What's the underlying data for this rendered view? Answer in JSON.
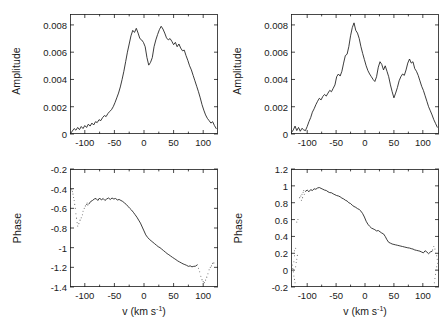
{
  "figure": {
    "background": "#ffffff",
    "line_color": "#1a1a1a",
    "noise_color": "#6e6e6e",
    "layout": "2x2 grid: amplitude spectra on top row, phase spectra on bottom row"
  },
  "axis_labels": {
    "amplitude": "Amplitude",
    "phase": "Phase",
    "velocity_prefix": "v (km s",
    "velocity_exponent": "-1",
    "velocity_suffix": ")"
  },
  "chart_data": [
    {
      "id": "top-left-amplitude",
      "type": "line",
      "title": "",
      "xlabel": "v (km s-1)",
      "ylabel": "Amplitude",
      "xlim": [
        -125,
        125
      ],
      "ylim": [
        0,
        0.0088
      ],
      "xticks": [
        -100,
        -50,
        0,
        50,
        100
      ],
      "xtick_labels": [
        "-100",
        "-50",
        "0",
        "50",
        "100"
      ],
      "yticks": [
        0,
        0.002,
        0.004,
        0.006,
        0.008
      ],
      "ytick_labels": [
        "0",
        "0.002",
        "0.004",
        "0.006",
        "0.008"
      ],
      "grid": false,
      "legend": "none",
      "x": [
        -124,
        -121,
        -118,
        -115,
        -112,
        -109,
        -106,
        -103,
        -100,
        -97,
        -94,
        -91,
        -88,
        -85,
        -82,
        -79,
        -76,
        -73,
        -70,
        -67,
        -64,
        -61,
        -58,
        -55,
        -52,
        -49,
        -46,
        -43,
        -40,
        -37,
        -34,
        -31,
        -28,
        -25,
        -22,
        -19,
        -16,
        -13,
        -10,
        -7,
        -4,
        -1,
        2,
        5,
        8,
        11,
        14,
        17,
        20,
        23,
        26,
        29,
        32,
        35,
        38,
        41,
        44,
        47,
        50,
        53,
        56,
        59,
        62,
        65,
        68,
        71,
        74,
        77,
        80,
        83,
        86,
        89,
        92,
        95,
        98,
        101,
        104,
        107,
        110,
        113,
        116,
        119,
        122
      ],
      "y": [
        5e-05,
        0.00022,
        0.0004,
        0.00028,
        0.00048,
        0.00032,
        0.00055,
        0.0004,
        0.00062,
        0.00048,
        0.00072,
        0.00058,
        0.0008,
        0.00066,
        0.0009,
        0.00084,
        0.00105,
        0.00098,
        0.0012,
        0.00135,
        0.00128,
        0.0015,
        0.00165,
        0.00178,
        0.002,
        0.0023,
        0.00265,
        0.003,
        0.00345,
        0.004,
        0.0046,
        0.0053,
        0.006,
        0.0066,
        0.0072,
        0.0076,
        0.00745,
        0.00775,
        0.0074,
        0.007,
        0.0069,
        0.00672,
        0.0064,
        0.0056,
        0.00505,
        0.00525,
        0.0056,
        0.0064,
        0.0069,
        0.0073,
        0.00765,
        0.0079,
        0.0077,
        0.0074,
        0.00705,
        0.0069,
        0.007,
        0.0068,
        0.00655,
        0.00672,
        0.0064,
        0.0066,
        0.0063,
        0.0061,
        0.00615,
        0.00575,
        0.0054,
        0.005,
        0.0047,
        0.0043,
        0.0039,
        0.0035,
        0.0031,
        0.00265,
        0.00215,
        0.00175,
        0.0014,
        0.00115,
        0.00098,
        0.0008,
        0.0009,
        0.00062,
        0.0004,
        0.0001
      ]
    },
    {
      "id": "top-right-amplitude",
      "type": "line",
      "title": "",
      "xlabel": "v (km s-1)",
      "ylabel": "Amplitude",
      "xlim": [
        -128,
        128
      ],
      "ylim": [
        0,
        0.0088
      ],
      "xticks": [
        -100,
        -50,
        0,
        50,
        100
      ],
      "xtick_labels": [
        "-100",
        "-50",
        "0",
        "50",
        "100"
      ],
      "yticks": [
        0,
        0.002,
        0.004,
        0.006,
        0.008
      ],
      "ytick_labels": [
        "0",
        "0.002",
        "0.004",
        "0.006",
        "0.008"
      ],
      "grid": false,
      "legend": "none",
      "x": [
        -127,
        -124,
        -121,
        -118,
        -115,
        -112,
        -109,
        -106,
        -103,
        -100,
        -97,
        -94,
        -91,
        -88,
        -85,
        -82,
        -79,
        -76,
        -73,
        -70,
        -67,
        -64,
        -61,
        -58,
        -55,
        -52,
        -49,
        -46,
        -43,
        -40,
        -37,
        -34,
        -31,
        -28,
        -25,
        -22,
        -19,
        -16,
        -13,
        -10,
        -7,
        -4,
        -1,
        2,
        5,
        8,
        11,
        14,
        17,
        20,
        23,
        26,
        29,
        32,
        35,
        38,
        41,
        44,
        47,
        50,
        53,
        56,
        59,
        62,
        65,
        68,
        71,
        74,
        77,
        80,
        83,
        86,
        89,
        92,
        95,
        98,
        101,
        104,
        107,
        110,
        113,
        116,
        119,
        122,
        125
      ],
      "y": [
        0.00012,
        0.0003,
        0.00058,
        0.00025,
        0.00048,
        0.0002,
        0.00042,
        0.0003,
        0.00025,
        0.00055,
        0.0009,
        0.0012,
        0.0016,
        0.00185,
        0.00215,
        0.0024,
        0.00262,
        0.0025,
        0.00275,
        0.0029,
        0.00278,
        0.003,
        0.0032,
        0.0031,
        0.00335,
        0.0036,
        0.0042,
        0.0044,
        0.00425,
        0.0046,
        0.0052,
        0.00575,
        0.00585,
        0.0064,
        0.0072,
        0.0078,
        0.00815,
        0.0076,
        0.0074,
        0.007,
        0.0064,
        0.0059,
        0.00545,
        0.005,
        0.00465,
        0.0044,
        0.0042,
        0.004,
        0.00385,
        0.0042,
        0.0049,
        0.0053,
        0.0051,
        0.0047,
        0.005,
        0.0046,
        0.0042,
        0.0036,
        0.0031,
        0.00265,
        0.003,
        0.0034,
        0.0039,
        0.0042,
        0.0044,
        0.0043,
        0.0047,
        0.0052,
        0.0055,
        0.0052,
        0.0053,
        0.0048,
        0.0046,
        0.0043,
        0.0039,
        0.0035,
        0.0032,
        0.0028,
        0.0024,
        0.002,
        0.0017,
        0.0014,
        0.00105,
        0.00078,
        0.0005
      ]
    },
    {
      "id": "bottom-left-phase",
      "type": "line",
      "title": "",
      "xlabel": "v (km s-1)",
      "ylabel": "Phase",
      "xlim": [
        -125,
        125
      ],
      "ylim": [
        -1.4,
        -0.2
      ],
      "xticks": [
        -100,
        -50,
        0,
        50,
        100
      ],
      "xtick_labels": [
        "-100",
        "-50",
        "0",
        "50",
        "100"
      ],
      "yticks": [
        -1.4,
        -1.2,
        -1.0,
        -0.8,
        -0.6,
        -0.4,
        -0.2
      ],
      "ytick_labels": [
        "-1.4",
        "-1.2",
        "-1",
        "-0.8",
        "-0.6",
        "-0.4",
        "-0.2"
      ],
      "grid": false,
      "legend": "none",
      "x": [
        -93,
        -90,
        -87,
        -84,
        -81,
        -78,
        -75,
        -72,
        -69,
        -66,
        -63,
        -60,
        -57,
        -54,
        -51,
        -48,
        -45,
        -42,
        -39,
        -36,
        -33,
        -30,
        -27,
        -24,
        -21,
        -18,
        -15,
        -12,
        -9,
        -6,
        -3,
        0,
        3,
        6,
        9,
        12,
        15,
        18,
        21,
        24,
        27,
        30,
        33,
        36,
        39,
        42,
        45,
        48,
        51,
        54,
        57,
        60,
        63,
        66,
        69,
        72,
        75,
        78,
        81,
        84,
        87,
        90
      ],
      "y": [
        -0.555,
        -0.53,
        -0.52,
        -0.505,
        -0.5,
        -0.52,
        -0.495,
        -0.515,
        -0.5,
        -0.52,
        -0.505,
        -0.495,
        -0.51,
        -0.495,
        -0.505,
        -0.5,
        -0.515,
        -0.51,
        -0.52,
        -0.53,
        -0.545,
        -0.56,
        -0.58,
        -0.6,
        -0.618,
        -0.64,
        -0.665,
        -0.69,
        -0.72,
        -0.75,
        -0.79,
        -0.83,
        -0.87,
        -0.895,
        -0.915,
        -0.93,
        -0.945,
        -0.96,
        -0.975,
        -0.99,
        -1.0,
        -1.015,
        -1.03,
        -1.045,
        -1.06,
        -1.072,
        -1.085,
        -1.098,
        -1.11,
        -1.122,
        -1.135,
        -1.145,
        -1.155,
        -1.165,
        -1.172,
        -1.18,
        -1.19,
        -1.185,
        -1.195,
        -1.19,
        -1.188,
        -1.175
      ],
      "noise_points": [
        {
          "x": -122,
          "y": -0.41
        },
        {
          "x": -121,
          "y": -0.43
        },
        {
          "x": -120,
          "y": -0.455
        },
        {
          "x": -119,
          "y": -0.49
        },
        {
          "x": -118,
          "y": -0.52
        },
        {
          "x": -117,
          "y": -0.56
        },
        {
          "x": -116,
          "y": -0.6
        },
        {
          "x": -115,
          "y": -0.655
        },
        {
          "x": -114,
          "y": -0.7
        },
        {
          "x": -113,
          "y": -0.745
        },
        {
          "x": -112,
          "y": -0.78
        },
        {
          "x": -110,
          "y": -0.755
        },
        {
          "x": -108,
          "y": -0.72
        },
        {
          "x": -106,
          "y": -0.695
        },
        {
          "x": -104,
          "y": -0.665
        },
        {
          "x": -103,
          "y": -0.63
        },
        {
          "x": -101,
          "y": -0.6
        },
        {
          "x": -99,
          "y": -0.575
        },
        {
          "x": -97,
          "y": -0.56
        },
        {
          "x": -96,
          "y": -0.545
        },
        {
          "x": -95,
          "y": -0.565
        },
        {
          "x": 92,
          "y": -1.21
        },
        {
          "x": 94,
          "y": -1.245
        },
        {
          "x": 96,
          "y": -1.29
        },
        {
          "x": 98,
          "y": -1.325
        },
        {
          "x": 100,
          "y": -1.345
        },
        {
          "x": 102,
          "y": -1.355
        },
        {
          "x": 104,
          "y": -1.33
        },
        {
          "x": 106,
          "y": -1.3
        },
        {
          "x": 108,
          "y": -1.265
        },
        {
          "x": 110,
          "y": -1.225
        },
        {
          "x": 112,
          "y": -1.2
        },
        {
          "x": 114,
          "y": -1.185
        },
        {
          "x": 116,
          "y": -1.16
        },
        {
          "x": 118,
          "y": -1.155
        }
      ]
    },
    {
      "id": "bottom-right-phase",
      "type": "line",
      "title": "",
      "xlabel": "v (km s-1)",
      "ylabel": "Phase",
      "xlim": [
        -128,
        128
      ],
      "ylim": [
        -0.2,
        1.2
      ],
      "xticks": [
        -100,
        -50,
        0,
        50,
        100
      ],
      "xtick_labels": [
        "-100",
        "-50",
        "0",
        "50",
        "100"
      ],
      "yticks": [
        -0.2,
        0,
        0.2,
        0.4,
        0.6,
        0.8,
        1.0,
        1.2
      ],
      "ytick_labels": [
        "-0.2",
        "0",
        "0.2",
        "0.4",
        "0.6",
        "0.8",
        "1",
        "1.2"
      ],
      "grid": false,
      "legend": "none",
      "x": [
        -103,
        -100,
        -97,
        -94,
        -91,
        -88,
        -85,
        -82,
        -79,
        -76,
        -73,
        -70,
        -67,
        -64,
        -61,
        -58,
        -55,
        -52,
        -49,
        -46,
        -43,
        -40,
        -37,
        -34,
        -31,
        -28,
        -25,
        -22,
        -19,
        -16,
        -13,
        -10,
        -7,
        -4,
        -1,
        2,
        5,
        8,
        11,
        14,
        17,
        20,
        23,
        26,
        29,
        32,
        35,
        38,
        41,
        44,
        47,
        50,
        53,
        56,
        59,
        62,
        65,
        68,
        71,
        74,
        77,
        80,
        83,
        86,
        89,
        92,
        95,
        98,
        101,
        104,
        107,
        110,
        113,
        116
      ],
      "y": [
        0.935,
        0.95,
        0.93,
        0.955,
        0.945,
        0.965,
        0.96,
        0.975,
        0.98,
        0.97,
        0.96,
        0.95,
        0.945,
        0.93,
        0.92,
        0.918,
        0.905,
        0.895,
        0.885,
        0.88,
        0.87,
        0.855,
        0.845,
        0.83,
        0.82,
        0.8,
        0.79,
        0.77,
        0.755,
        0.745,
        0.73,
        0.72,
        0.7,
        0.67,
        0.63,
        0.58,
        0.545,
        0.52,
        0.5,
        0.49,
        0.48,
        0.465,
        0.47,
        0.455,
        0.44,
        0.43,
        0.4,
        0.36,
        0.33,
        0.32,
        0.31,
        0.305,
        0.3,
        0.295,
        0.29,
        0.285,
        0.28,
        0.275,
        0.27,
        0.265,
        0.262,
        0.255,
        0.25,
        0.24,
        0.235,
        0.23,
        0.225,
        0.215,
        0.205,
        0.23,
        0.215,
        0.195,
        0.215,
        0.225
      ],
      "noise_points": [
        {
          "x": -126,
          "y": 0.06
        },
        {
          "x": -125,
          "y": 0.02
        },
        {
          "x": -124,
          "y": -0.02
        },
        {
          "x": -123,
          "y": -0.07
        },
        {
          "x": -122,
          "y": -0.11
        },
        {
          "x": -121,
          "y": -0.15
        },
        {
          "x": -120,
          "y": 0.04
        },
        {
          "x": -119,
          "y": 0.09
        },
        {
          "x": -118,
          "y": 0.13
        },
        {
          "x": -117,
          "y": 0.175
        },
        {
          "x": -122,
          "y": 0.23
        },
        {
          "x": -120,
          "y": 0.26
        },
        {
          "x": -124,
          "y": 0.01
        },
        {
          "x": -123,
          "y": 0.1
        },
        {
          "x": -122,
          "y": 0.17
        },
        {
          "x": -118,
          "y": 0.57
        },
        {
          "x": -116,
          "y": 0.6
        },
        {
          "x": -113,
          "y": 0.86
        },
        {
          "x": -111,
          "y": 0.88
        },
        {
          "x": -109,
          "y": 0.9
        },
        {
          "x": -107,
          "y": 0.925
        },
        {
          "x": -106,
          "y": 0.945
        },
        {
          "x": -105,
          "y": 0.9
        },
        {
          "x": -108,
          "y": 0.86
        },
        {
          "x": -110,
          "y": 0.83
        },
        {
          "x": 117,
          "y": 0.24
        },
        {
          "x": 119,
          "y": 0.28
        },
        {
          "x": 121,
          "y": 0.25
        },
        {
          "x": 122,
          "y": 0.2
        },
        {
          "x": 124,
          "y": 0.17
        },
        {
          "x": 125,
          "y": 0.13
        },
        {
          "x": 126,
          "y": 0.08
        },
        {
          "x": 124,
          "y": 0.04
        },
        {
          "x": 123,
          "y": 0.0
        },
        {
          "x": 122,
          "y": -0.05
        },
        {
          "x": 121,
          "y": -0.1
        },
        {
          "x": 120,
          "y": -0.15
        }
      ]
    }
  ]
}
